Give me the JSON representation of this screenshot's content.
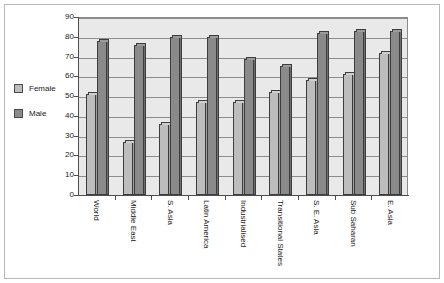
{
  "chart_data": {
    "type": "bar",
    "title": "",
    "subtitle": "",
    "xlabel": "",
    "ylabel": "",
    "ylim": [
      0,
      90
    ],
    "y_ticks": [
      0,
      10,
      20,
      30,
      40,
      50,
      60,
      70,
      80,
      90
    ],
    "grid": true,
    "legend_position": "left",
    "categories": [
      "World",
      "Middle East",
      "S. Asia",
      "Latin America",
      "Industrialised",
      "Transitional States",
      "S. E. Asia",
      "Sub Saharan",
      "E. Asia"
    ],
    "series": [
      {
        "name": "Female",
        "color": "#bdbdbd",
        "values": [
          51,
          27,
          36,
          47,
          47,
          52,
          58,
          61,
          72
        ]
      },
      {
        "name": "Male",
        "color": "#8a8a8a",
        "values": [
          78,
          76,
          80,
          80,
          69,
          65,
          82,
          83,
          83
        ]
      }
    ]
  },
  "legend": {
    "items": [
      {
        "label": "Female",
        "color": "#bdbdbd"
      },
      {
        "label": "Male",
        "color": "#8a8a8a"
      }
    ]
  }
}
